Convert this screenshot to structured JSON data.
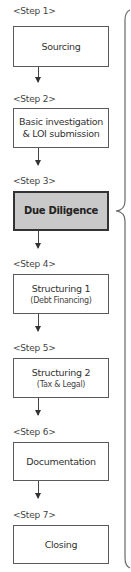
{
  "diagram": {
    "type": "process-flow",
    "steps": [
      {
        "label": "<Step 1>",
        "title": "Sourcing",
        "subtitle": null
      },
      {
        "label": "<Step 2>",
        "title": "Basic investigation",
        "subtitle": "& LOI submission"
      },
      {
        "label": "<Step 3>",
        "title": "Due Diligence",
        "subtitle": null,
        "highlighted": true
      },
      {
        "label": "<Step 4>",
        "title": "Structuring 1",
        "subtitle": "(Debt Financing)"
      },
      {
        "label": "<Step 5>",
        "title": "Structuring 2",
        "subtitle": "(Tax & Legal)"
      },
      {
        "label": "<Step 6>",
        "title": "Documentation",
        "subtitle": null
      },
      {
        "label": "<Step 7>",
        "title": "Closing",
        "subtitle": null
      }
    ],
    "brace": {
      "points_to_step": 3,
      "spans": "Step 1 to Step 7"
    },
    "colors": {
      "border": "#5a5a5a",
      "highlight_fill": "#c9c9c9",
      "highlight_border": "#333333",
      "text": "#333333"
    }
  }
}
